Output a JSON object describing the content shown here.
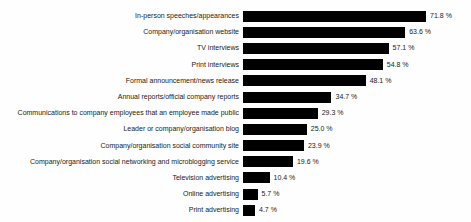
{
  "chart_data": {
    "type": "bar",
    "orientation": "horizontal",
    "title": "",
    "xlabel": "",
    "ylabel": "",
    "grid": false,
    "legend": false,
    "axes_visible": false,
    "xlim": [
      0,
      88
    ],
    "bar_color": "#000000",
    "text_color": "#1a1a1a",
    "background_color": "#fefefe",
    "categories": [
      "In-person speeches/appearances",
      "Company/organisation website",
      "TV interviews",
      "Print interviews",
      "Formal announcement/news release",
      "Annual reports/official company reports",
      "Communications to company employees that an employee made public",
      "Leader or company/organisation blog",
      "Company/organisation social community site",
      "Company/organisation social networking and microblogging service",
      "Television advertising",
      "Online advertising",
      "Print advertising"
    ],
    "values": [
      71.8,
      63.6,
      57.1,
      54.8,
      48.1,
      34.7,
      29.3,
      25.0,
      23.9,
      19.6,
      10.4,
      5.7,
      4.7
    ],
    "value_labels": [
      "71.8 %",
      "63.6 %",
      "57.1 %",
      "54.8 %",
      "48.1 %",
      "34.7 %",
      "29.3 %",
      "25.0 %",
      "23.9 %",
      "19.6 %",
      "10.4 %",
      "5.7 %",
      "4.7 %"
    ]
  }
}
